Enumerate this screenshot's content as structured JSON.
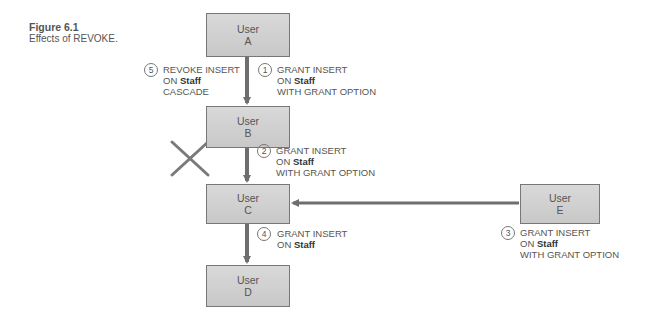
{
  "figure": {
    "number": "Figure 6.1",
    "title": "Effects of REVOKE."
  },
  "users": [
    {
      "id": "A",
      "line1": "User",
      "line2": "A"
    },
    {
      "id": "B",
      "line1": "User",
      "line2": "B"
    },
    {
      "id": "C",
      "line1": "User",
      "line2": "C"
    },
    {
      "id": "D",
      "line1": "User",
      "line2": "D"
    },
    {
      "id": "E",
      "line1": "User",
      "line2": "E"
    }
  ],
  "steps": [
    {
      "num": "1",
      "line1": "GRANT INSERT",
      "line2_prefix": "ON ",
      "line2_bold": "Staff",
      "line3": "WITH GRANT OPTION"
    },
    {
      "num": "2",
      "line1": "GRANT INSERT",
      "line2_prefix": "ON ",
      "line2_bold": "Staff",
      "line3": "WITH GRANT OPTION"
    },
    {
      "num": "3",
      "line1": "GRANT INSERT",
      "line2_prefix": "ON ",
      "line2_bold": "Staff",
      "line3": "WITH GRANT OPTION"
    },
    {
      "num": "4",
      "line1": "GRANT INSERT",
      "line2_prefix": "ON ",
      "line2_bold": "Staff",
      "line3": ""
    },
    {
      "num": "5",
      "line1": "REVOKE INSERT",
      "line2_prefix": "ON ",
      "line2_bold": "Staff",
      "line3": "CASCADE"
    }
  ],
  "colors": {
    "box_fill": "#cfcfcf",
    "arrow": "#6e6e6e",
    "cross": "#7a7a7a",
    "text": "#555555"
  }
}
